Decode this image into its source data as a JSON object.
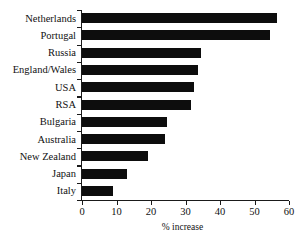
{
  "chart_data": {
    "type": "bar",
    "orientation": "horizontal",
    "title": "",
    "xlabel": "% increase",
    "ylabel": "",
    "xlim": [
      0,
      60
    ],
    "xticks": [
      0,
      10,
      20,
      30,
      40,
      50,
      60
    ],
    "grid": false,
    "legend": false,
    "categories": [
      "Netherlands",
      "Portugal",
      "Russia",
      "England/Wales",
      "USA",
      "RSA",
      "Bulgaria",
      "Australia",
      "New Zealand",
      "Japan",
      "Italy"
    ],
    "values": [
      56.5,
      54.5,
      34.5,
      33.5,
      32.5,
      31.5,
      24.5,
      24,
      19,
      13,
      9
    ],
    "bar_color": "#0d0d0d",
    "axis_color": "#1a1a1a",
    "background_color": "#ffffff"
  }
}
